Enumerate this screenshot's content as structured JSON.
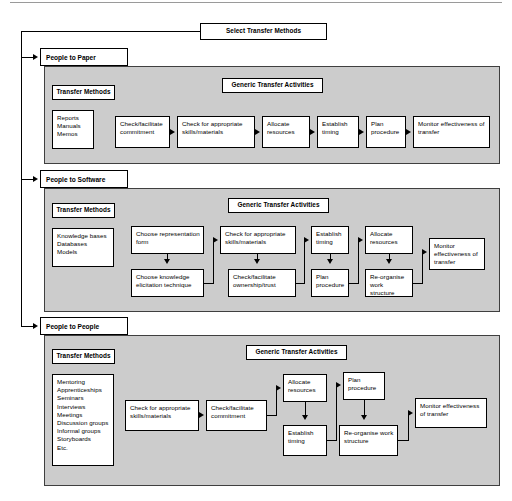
{
  "title_box": {
    "label": "Select Transfer Methods"
  },
  "sections": [
    {
      "id": "people-to-paper",
      "header": "People to Paper",
      "methods_header": "Transfer Methods",
      "activities_header": "Generic Transfer Activities",
      "methods_list": "Reports\nManuals\nMemos",
      "activities": [
        "Check/facilitate commitment",
        "Check for appropriate skills/materials",
        "Allocate resources",
        "Establish timing",
        "Plan procedure",
        "Monitor effectiveness of transfer"
      ]
    },
    {
      "id": "people-to-software",
      "header": "People to Software",
      "methods_header": "Transfer Methods",
      "activities_header": "Generic Transfer Activities",
      "methods_list": "Knowledge bases\nDatabases\nModels",
      "activities": [
        "Choose representation form",
        "Choose knowledge elicitation technique",
        "Check for appropriate skills/materials",
        "Check/facilitate ownership/trust",
        "Establish timing",
        "Plan procedure",
        "Allocate resources",
        "Re-organise work structure",
        "Monitor effectiveness of transfer"
      ]
    },
    {
      "id": "people-to-people",
      "header": "People to People",
      "methods_header": "Transfer Methods",
      "activities_header": "Generic Transfer Activities",
      "methods_list": "Mentoring\nApprenticeships\nSeminars\nInterviews\nMeetings\nDiscussion groups\nInformal groups\nStoryboards\nEtc.",
      "activities": [
        "Check for appropriate skills/materials",
        "Check/facilitate commitment",
        "Allocate resources",
        "Establish timing",
        "Plan procedure",
        "Re-organise work structure",
        "Monitor effectiveness of transfer"
      ]
    }
  ],
  "colors": {
    "panel_fill": "#cccccc",
    "node_fill": "#ffffff",
    "stroke": "#000000"
  }
}
